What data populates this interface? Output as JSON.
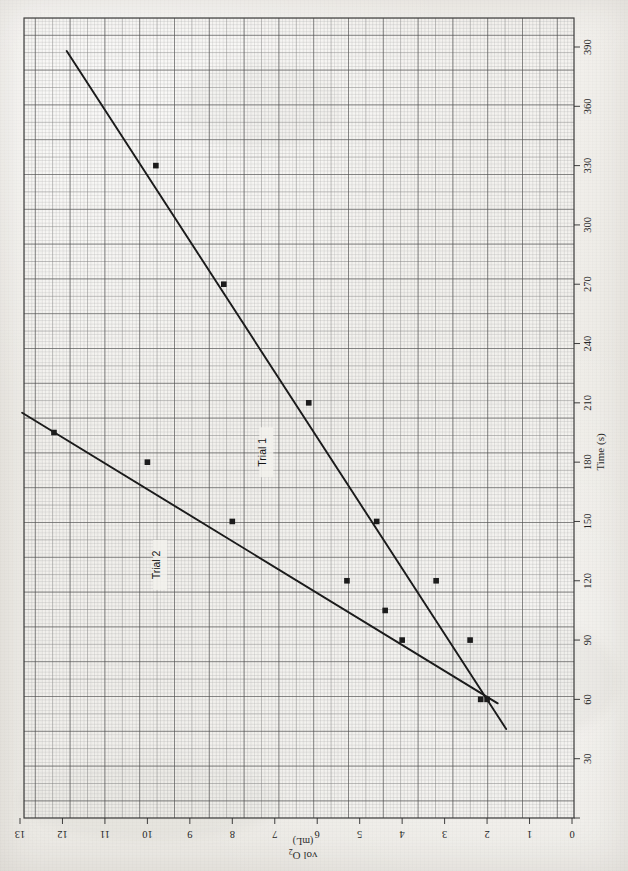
{
  "figure": {
    "kind": "hand-plotted graph on millimeter graph paper (scanned, rotated 90 degrees)",
    "orientation_note": "page is rotated: axes read sideways"
  },
  "chart_data": {
    "type": "scatter",
    "title": "",
    "xlabel": "Time (s)",
    "ylabel": "vol O2 (mL)",
    "ylabel_main": "vol O",
    "ylabel_sub": "2",
    "ylabel_units": "(mL)",
    "xlim": [
      0,
      400
    ],
    "ylim": [
      0,
      13.3
    ],
    "xticks": [
      0,
      30,
      60,
      90,
      120,
      150,
      180,
      210,
      240,
      270,
      300,
      330,
      360,
      390
    ],
    "xticklabels": [
      "0",
      "30",
      "60",
      "90",
      "120",
      "150",
      "180",
      "210",
      "240",
      "270",
      "300",
      "330",
      "360",
      "390"
    ],
    "yticks": [
      0,
      1,
      2,
      3,
      4,
      5,
      6,
      7,
      8,
      9,
      10,
      11,
      12,
      13
    ],
    "yticklabels": [
      "0",
      "1",
      "2",
      "3",
      "4",
      "5",
      "6",
      "7",
      "8",
      "9",
      "10",
      "11",
      "12",
      "13"
    ],
    "grid": true,
    "grid_style": "millimeter graph paper, minor every 2 s / 0.1 mL, major every 30 s / 1 mL",
    "legend": "inline labels on lines",
    "series": [
      {
        "name": "Trial 1",
        "label": "Trial 1",
        "color": "#1a1a1a",
        "marker": "square",
        "points": [
          {
            "x": 60,
            "y": 2.0
          },
          {
            "x": 90,
            "y": 2.4
          },
          {
            "x": 120,
            "y": 3.2
          },
          {
            "x": 150,
            "y": 4.6
          },
          {
            "x": 210,
            "y": 6.2
          },
          {
            "x": 270,
            "y": 8.2
          },
          {
            "x": 330,
            "y": 9.8
          }
        ],
        "fit_line": {
          "x0": 45,
          "y0": 1.55,
          "x1": 388,
          "y1": 11.9
        },
        "annotation": {
          "text": "Trial 1",
          "x": 185,
          "y": 7.2
        }
      },
      {
        "name": "Trial 2",
        "label": "Trial 2",
        "color": "#1a1a1a",
        "marker": "square",
        "points": [
          {
            "x": 60,
            "y": 2.15
          },
          {
            "x": 90,
            "y": 4.0
          },
          {
            "x": 105,
            "y": 4.4
          },
          {
            "x": 120,
            "y": 5.3
          },
          {
            "x": 150,
            "y": 8.0
          },
          {
            "x": 180,
            "y": 10.0
          },
          {
            "x": 195,
            "y": 12.2
          }
        ],
        "fit_line": {
          "x0": 58,
          "y0": 1.75,
          "x1": 205,
          "y1": 12.95
        },
        "annotation": {
          "text": "Trial 2",
          "x": 128,
          "y": 9.7
        }
      }
    ],
    "annotations": [
      {
        "name": "trial-1-label",
        "text": "Trial 1"
      },
      {
        "name": "trial-2-label",
        "text": "Trial 2"
      }
    ]
  }
}
